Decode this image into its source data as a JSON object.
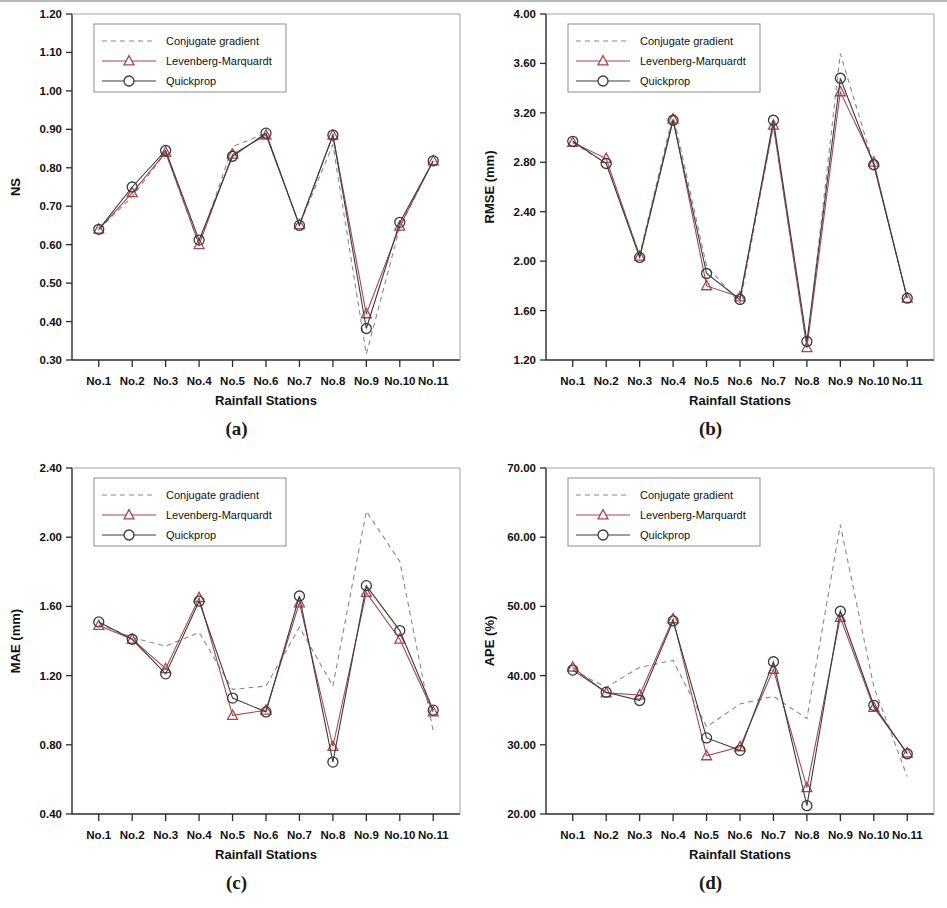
{
  "figure": {
    "stations": [
      "No.1",
      "No.2",
      "No.3",
      "No.4",
      "No.5",
      "No.6",
      "No.7",
      "No.8",
      "No.9",
      "No.10",
      "No.11"
    ],
    "xlabel": "Rainfall Stations",
    "legend": {
      "conjugate": "Conjugate gradient",
      "levenberg": "Levenberg-Marquardt",
      "quickprop": "Quickprop"
    },
    "colors": {
      "conjugate": "#8a8a8a",
      "levenberg": "#a8474c",
      "quickprop": "#3b3b3b",
      "axis": "#2b2b2b"
    },
    "captions": {
      "a": "(a)",
      "b": "(b)",
      "c": "(c)",
      "d": "(d)"
    }
  },
  "chart_data": [
    {
      "panel": "a",
      "type": "line",
      "title": "",
      "xlabel": "Rainfall Stations",
      "ylabel": "NS",
      "categories": [
        "No.1",
        "No.2",
        "No.3",
        "No.4",
        "No.5",
        "No.6",
        "No.7",
        "No.8",
        "No.9",
        "No.10",
        "No.11"
      ],
      "ylim": [
        0.3,
        1.2
      ],
      "ytick_step": 0.1,
      "yticks": [
        "0.30",
        "0.40",
        "0.50",
        "0.60",
        "0.70",
        "0.80",
        "0.90",
        "1.00",
        "1.10",
        "1.20"
      ],
      "grid": false,
      "legend_position": "top-left",
      "series": [
        {
          "name": "Conjugate gradient",
          "values": [
            0.64,
            0.725,
            0.84,
            0.6,
            0.855,
            0.89,
            0.65,
            0.86,
            0.315,
            0.645,
            0.82
          ]
        },
        {
          "name": "Levenberg-Marquardt",
          "values": [
            0.64,
            0.735,
            0.84,
            0.6,
            0.835,
            0.885,
            0.652,
            0.885,
            0.42,
            0.648,
            0.818
          ]
        },
        {
          "name": "Quickprop",
          "values": [
            0.64,
            0.75,
            0.845,
            0.612,
            0.83,
            0.89,
            0.65,
            0.885,
            0.382,
            0.658,
            0.818
          ]
        }
      ]
    },
    {
      "panel": "b",
      "type": "line",
      "title": "",
      "xlabel": "Rainfall Stations",
      "ylabel": "RMSE (mm)",
      "categories": [
        "No.1",
        "No.2",
        "No.3",
        "No.4",
        "No.5",
        "No.6",
        "No.7",
        "No.8",
        "No.9",
        "No.10",
        "No.11"
      ],
      "ylim": [
        1.2,
        4.0
      ],
      "ytick_step": 0.4,
      "yticks": [
        "1.20",
        "1.60",
        "2.00",
        "2.40",
        "2.80",
        "3.20",
        "3.60",
        "4.00"
      ],
      "grid": false,
      "legend_position": "top-left",
      "series": [
        {
          "name": "Conjugate gradient",
          "values": [
            2.96,
            2.79,
            2.05,
            3.19,
            1.96,
            1.66,
            3.1,
            1.3,
            3.68,
            2.78,
            1.7
          ]
        },
        {
          "name": "Levenberg-Marquardt",
          "values": [
            2.96,
            2.83,
            2.04,
            3.15,
            1.8,
            1.71,
            3.1,
            1.3,
            3.37,
            2.8,
            1.7
          ]
        },
        {
          "name": "Quickprop",
          "values": [
            2.97,
            2.79,
            2.03,
            3.14,
            1.9,
            1.69,
            3.14,
            1.35,
            3.48,
            2.78,
            1.7
          ]
        }
      ]
    },
    {
      "panel": "c",
      "type": "line",
      "title": "",
      "xlabel": "Rainfall Stations",
      "ylabel": "MAE (mm)",
      "categories": [
        "No.1",
        "No.2",
        "No.3",
        "No.4",
        "No.5",
        "No.6",
        "No.7",
        "No.8",
        "No.9",
        "No.10",
        "No.11"
      ],
      "ylim": [
        0.4,
        2.4
      ],
      "ytick_step": 0.4,
      "yticks": [
        "0.40",
        "0.80",
        "1.20",
        "1.60",
        "2.00",
        "2.40"
      ],
      "grid": false,
      "legend_position": "top-left",
      "series": [
        {
          "name": "Conjugate gradient",
          "values": [
            1.5,
            1.42,
            1.37,
            1.45,
            1.12,
            1.14,
            1.48,
            1.14,
            2.15,
            1.86,
            0.88
          ]
        },
        {
          "name": "Levenberg-Marquardt",
          "values": [
            1.49,
            1.41,
            1.24,
            1.65,
            0.97,
            1.0,
            1.62,
            0.79,
            1.68,
            1.41,
            0.99
          ]
        },
        {
          "name": "Quickprop",
          "values": [
            1.51,
            1.41,
            1.21,
            1.63,
            1.07,
            0.99,
            1.66,
            0.7,
            1.72,
            1.46,
            1.0
          ]
        }
      ]
    },
    {
      "panel": "d",
      "type": "line",
      "title": "",
      "xlabel": "Rainfall Stations",
      "ylabel": "APE (%)",
      "categories": [
        "No.1",
        "No.2",
        "No.3",
        "No.4",
        "No.5",
        "No.6",
        "No.7",
        "No.8",
        "No.9",
        "No.10",
        "No.11"
      ],
      "ylim": [
        20.0,
        70.0
      ],
      "ytick_step": 10.0,
      "yticks": [
        "20.00",
        "30.00",
        "40.00",
        "50.00",
        "60.00",
        "70.00"
      ],
      "grid": false,
      "legend_position": "top-left",
      "series": [
        {
          "name": "Conjugate gradient",
          "values": [
            40.8,
            38.3,
            41.2,
            42.2,
            32.6,
            35.9,
            37.0,
            33.8,
            61.8,
            38.4,
            25.4
          ]
        },
        {
          "name": "Levenberg-Marquardt",
          "values": [
            41.2,
            37.5,
            37.2,
            48.2,
            28.4,
            29.7,
            40.9,
            23.8,
            48.4,
            35.4,
            28.8
          ]
        },
        {
          "name": "Quickprop",
          "values": [
            40.8,
            37.6,
            36.4,
            47.9,
            31.0,
            29.2,
            42.0,
            21.2,
            49.3,
            35.7,
            28.7
          ]
        }
      ]
    }
  ]
}
